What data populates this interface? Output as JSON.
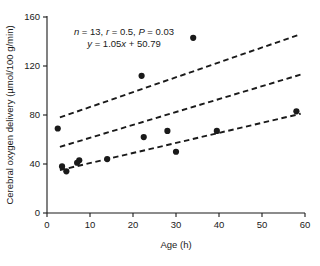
{
  "chart_data": {
    "type": "scatter",
    "title": "",
    "xlabel": "Age (h)",
    "ylabel": "Cerebral oxygen delivery (µmol/100 g/min)",
    "xlim": [
      0,
      60
    ],
    "ylim": [
      0,
      160
    ],
    "xticks": [
      0,
      10,
      20,
      30,
      40,
      50,
      60
    ],
    "yticks": [
      0,
      40,
      80,
      120,
      160
    ],
    "xtick_labels": [
      "0",
      "10",
      "20",
      "30",
      "40",
      "50",
      "60"
    ],
    "ytick_labels": [
      "0",
      "40",
      "80",
      "120",
      "160"
    ],
    "grid": false,
    "legend": null,
    "points": [
      {
        "x": 2.5,
        "y": 69
      },
      {
        "x": 3.5,
        "y": 38
      },
      {
        "x": 4.5,
        "y": 34
      },
      {
        "x": 7.0,
        "y": 41
      },
      {
        "x": 7.5,
        "y": 43
      },
      {
        "x": 14.0,
        "y": 44
      },
      {
        "x": 22.0,
        "y": 112
      },
      {
        "x": 22.5,
        "y": 62
      },
      {
        "x": 28.0,
        "y": 67
      },
      {
        "x": 30.0,
        "y": 50
      },
      {
        "x": 34.0,
        "y": 143
      },
      {
        "x": 39.5,
        "y": 67
      },
      {
        "x": 58.0,
        "y": 83
      }
    ],
    "n": 13,
    "r": 0.5,
    "p": 0.03,
    "slope": 1.05,
    "intercept": 50.79,
    "regression_line": {
      "name": "fit",
      "x": [
        3,
        59
      ],
      "y": [
        54,
        113
      ]
    },
    "confidence_bands": [
      {
        "name": "upper",
        "x": [
          3,
          59
        ],
        "y": [
          78,
          146
        ]
      },
      {
        "name": "lower",
        "x": [
          3,
          59
        ],
        "y": [
          35,
          81
        ]
      }
    ],
    "annotation_line1": "n = 13, r = 0.5, P = 0.03",
    "annotation_line2": "y = 1.05x + 50.79",
    "annotation_parts": {
      "n_sym": "n",
      "n_val": " = 13, ",
      "r_sym": "r",
      "r_val": " = 0.5, ",
      "p_sym": "P",
      "p_val": " = 0.03",
      "y_sym": "y",
      "eq_a": " = 1.05",
      "x_sym": "x",
      "eq_b": " + 50.79"
    },
    "colors": {
      "axis": "#1a1a1a",
      "marker": "#1a1a1a",
      "line": "#1a1a1a",
      "background": "#ffffff"
    }
  }
}
